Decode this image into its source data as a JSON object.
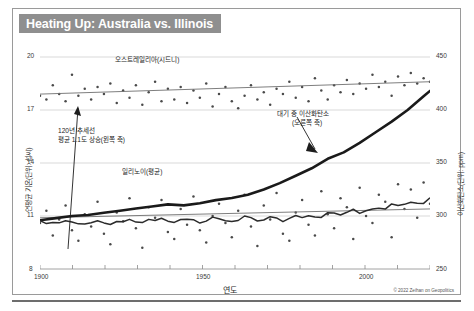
{
  "title": "Heating Up: Australia vs. Illinois",
  "credit": "© 2022 Zeihan on Geopolitics",
  "axes": {
    "x_title": "연도",
    "x_ticks": [
      "1900",
      "1950",
      "2000"
    ],
    "left_title": "연평균 기온(단위: 섭씨)",
    "left_ticks": [
      "20",
      "17",
      "14",
      "11",
      "8"
    ],
    "right_title": "이산화탄소(단위: ppm)",
    "right_ticks": [
      "450",
      "400",
      "350",
      "300",
      "250"
    ]
  },
  "annotations": {
    "australia": "오스트레일리아(시드니)",
    "illinois": "일리노이(평균)",
    "trend_line1": "120년 추세선",
    "trend_line2": "평균 1.1도 상승(왼쪽 축)",
    "co2_line1": "대기 중 이산화탄소",
    "co2_line2": "(오른쪽 축)"
  },
  "colors": {
    "title_bg": "#8f8f8f",
    "title_fg": "#ffffff",
    "grid": "#c9c9c9",
    "axis": "#8a8a8a",
    "scatter": "#4a4a4a",
    "trend": "#6f6f6f",
    "illinois_line": "#2b2b2b",
    "co2_line": "#1a1a1a"
  },
  "chart_data": {
    "type": "scatter",
    "title": "Heating Up: Australia vs. Illinois",
    "xlabel": "연도",
    "ylabel": "연평균 기온(단위: 섭씨)",
    "y2label": "이산화탄소(단위: ppm)",
    "xlim": [
      1900,
      2022
    ],
    "ylim": [
      8,
      20
    ],
    "y2lim": [
      250,
      450
    ],
    "grid": true,
    "legend": "annotations-inline",
    "series": [
      {
        "name": "오스트레일리아(시드니)",
        "type": "scatter",
        "axis": "left",
        "x": [
          1900,
          1902,
          1904,
          1906,
          1908,
          1910,
          1912,
          1914,
          1916,
          1918,
          1920,
          1922,
          1924,
          1926,
          1928,
          1930,
          1932,
          1934,
          1936,
          1938,
          1940,
          1942,
          1944,
          1946,
          1948,
          1950,
          1952,
          1954,
          1956,
          1958,
          1960,
          1962,
          1964,
          1966,
          1968,
          1970,
          1972,
          1974,
          1976,
          1978,
          1980,
          1982,
          1984,
          1986,
          1988,
          1990,
          1992,
          1994,
          1996,
          1998,
          2000,
          2002,
          2004,
          2006,
          2008,
          2010,
          2012,
          2014,
          2016,
          2018,
          2020,
          2022
        ],
        "y": [
          17.8,
          17.6,
          18.4,
          17.9,
          17.5,
          19.0,
          17.8,
          18.2,
          17.6,
          18.3,
          17.9,
          18.5,
          17.4,
          18.1,
          17.7,
          18.4,
          17.3,
          18.0,
          18.6,
          17.5,
          18.2,
          17.6,
          18.3,
          17.4,
          18.1,
          17.7,
          18.5,
          17.2,
          17.9,
          18.3,
          17.5,
          17.1,
          17.8,
          18.4,
          17.6,
          18.0,
          17.3,
          18.2,
          17.9,
          18.6,
          17.7,
          18.3,
          17.5,
          18.8,
          18.1,
          17.6,
          18.4,
          18.0,
          18.7,
          17.9,
          18.5,
          18.2,
          19.0,
          18.3,
          18.6,
          17.8,
          18.9,
          18.4,
          19.1,
          18.5,
          18.8,
          18.6
        ]
      },
      {
        "name": "오스트레일리아 추세선",
        "type": "line",
        "axis": "left",
        "x": [
          1900,
          2022
        ],
        "y": [
          17.9,
          18.6
        ]
      },
      {
        "name": "일리노이(평균) 관측점",
        "type": "scatter",
        "axis": "left",
        "x": [
          1900,
          1902,
          1904,
          1906,
          1908,
          1910,
          1912,
          1914,
          1916,
          1918,
          1920,
          1922,
          1924,
          1926,
          1928,
          1930,
          1932,
          1934,
          1936,
          1938,
          1940,
          1942,
          1944,
          1946,
          1948,
          1950,
          1952,
          1954,
          1956,
          1958,
          1960,
          1962,
          1964,
          1966,
          1968,
          1970,
          1972,
          1974,
          1976,
          1978,
          1980,
          1982,
          1984,
          1986,
          1988,
          1990,
          1992,
          1994,
          1996,
          1998,
          2000,
          2002,
          2004,
          2006,
          2008,
          2010,
          2012,
          2014,
          2016,
          2018,
          2020,
          2022
        ],
        "y": [
          10.6,
          11.3,
          9.9,
          10.8,
          11.6,
          10.2,
          9.6,
          11.1,
          10.4,
          11.8,
          10.0,
          9.4,
          11.2,
          10.7,
          12.0,
          10.3,
          9.2,
          11.5,
          10.9,
          11.9,
          10.1,
          9.7,
          11.4,
          10.5,
          12.1,
          10.2,
          9.5,
          11.0,
          11.7,
          10.6,
          9.8,
          11.3,
          12.2,
          10.4,
          9.3,
          11.6,
          10.8,
          12.3,
          10.0,
          9.6,
          11.2,
          11.9,
          10.5,
          9.9,
          12.4,
          11.1,
          10.3,
          12.0,
          11.5,
          9.7,
          12.6,
          11.0,
          10.6,
          12.2,
          11.8,
          9.8,
          12.8,
          11.4,
          12.5,
          10.9,
          12.9,
          11.7
        ]
      },
      {
        "name": "일리노이 추세선",
        "type": "line",
        "axis": "left",
        "x": [
          1900,
          2022
        ],
        "y": [
          10.9,
          11.4
        ]
      },
      {
        "name": "대기 중 이산화탄소",
        "type": "line",
        "axis": "right",
        "x": [
          1900,
          1905,
          1910,
          1915,
          1920,
          1925,
          1930,
          1935,
          1940,
          1945,
          1950,
          1955,
          1960,
          1965,
          1970,
          1975,
          1980,
          1985,
          1990,
          1995,
          2000,
          2005,
          2010,
          2015,
          2020,
          2022
        ],
        "y": [
          296,
          298,
          300,
          301,
          303,
          305,
          307,
          309,
          311,
          310,
          312,
          315,
          317,
          320,
          325,
          331,
          338,
          345,
          354,
          360,
          369,
          379,
          389,
          400,
          413,
          418
        ]
      }
    ],
    "annotations": [
      {
        "text": "오스트레일리아(시드니)",
        "x": 1930,
        "y": 19.4
      },
      {
        "text": "일리노이(평균)",
        "x": 1935,
        "y": 13.6
      },
      {
        "text": "120년 추세선 / 평균 1.1도 상승(왼쪽 축)",
        "x": 1910,
        "y": 14.6
      },
      {
        "text": "대기 중 이산화탄소 (오른쪽 축)",
        "x": 1975,
        "y": 16.9
      }
    ]
  }
}
